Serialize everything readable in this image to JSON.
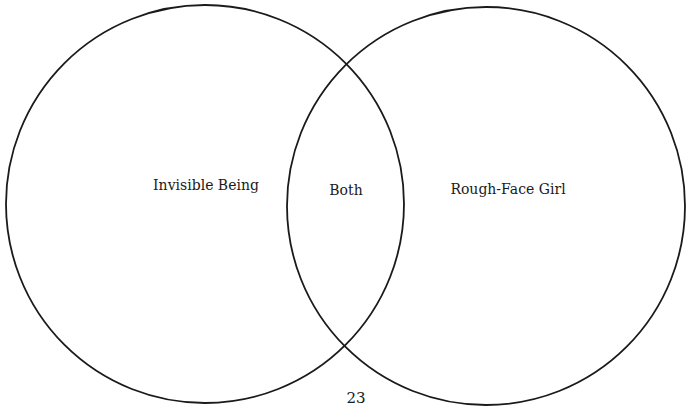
{
  "diagram": {
    "type": "venn",
    "stroke_color": "#1a1a1a",
    "background_color": "#ffffff",
    "circles": [
      {
        "id": "left",
        "cx": 205,
        "cy": 204,
        "r": 199
      },
      {
        "id": "right",
        "cx": 486,
        "cy": 206,
        "r": 199
      }
    ],
    "labels": {
      "left": "Invisible Being",
      "overlap": "Both",
      "right": "Rough-Face Girl"
    }
  },
  "page": {
    "number": "23"
  }
}
